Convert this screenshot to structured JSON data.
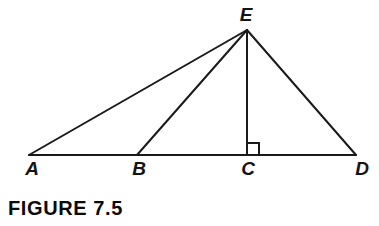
{
  "figure": {
    "caption": "FIGURE 7.5",
    "background_color": "#ffffff",
    "stroke_color": "#1a1a1a",
    "stroke_width": 2,
    "width": 379,
    "height": 226
  },
  "diagram": {
    "type": "geometry-triangle-diagram",
    "points": {
      "A": {
        "label": "A",
        "x": 29,
        "y": 155,
        "label_x": 32,
        "label_y": 159
      },
      "B": {
        "label": "B",
        "x": 137,
        "y": 155,
        "label_x": 139,
        "label_y": 159
      },
      "C": {
        "label": "C",
        "x": 247,
        "y": 155,
        "label_x": 248,
        "label_y": 159
      },
      "D": {
        "label": "D",
        "x": 356,
        "y": 155,
        "label_x": 362,
        "label_y": 159
      },
      "E": {
        "label": "E",
        "x": 247,
        "y": 30,
        "label_x": 246,
        "label_y": 5
      }
    },
    "segments": [
      {
        "name": "base-AD",
        "from": "A",
        "to": "D"
      },
      {
        "name": "side-AE",
        "from": "A",
        "to": "E"
      },
      {
        "name": "cevian-BE",
        "from": "B",
        "to": "E"
      },
      {
        "name": "altitude-CE",
        "from": "C",
        "to": "E"
      },
      {
        "name": "side-DE",
        "from": "D",
        "to": "E"
      }
    ],
    "right_angle_marker": {
      "name": "right-angle-at-C",
      "at_point": "C",
      "size": 12,
      "orientation": "upper-right"
    },
    "vertex_label_order": [
      "A",
      "B",
      "C",
      "D",
      "E"
    ]
  }
}
